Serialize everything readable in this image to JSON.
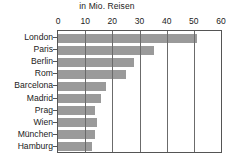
{
  "chart_data": {
    "type": "bar",
    "orientation": "horizontal",
    "title": "in Mio. Reisen",
    "xlabel": "",
    "ylabel": "",
    "xlim": [
      0,
      60
    ],
    "xticks": [
      0,
      10,
      20,
      30,
      40,
      50,
      60
    ],
    "grid": true,
    "grid_axis": "x",
    "legend": false,
    "bar_color": "#9a9a9a",
    "axis_color": "#555555",
    "background": "#ffffff",
    "categories": [
      "London",
      "Paris",
      "Berlin",
      "Rom",
      "Barcelona",
      "Madrid",
      "Prag",
      "Wien",
      "München",
      "Hamburg"
    ],
    "values": [
      51,
      35.5,
      28,
      25,
      17.5,
      16,
      13.5,
      14.5,
      13.5,
      12.5
    ]
  }
}
